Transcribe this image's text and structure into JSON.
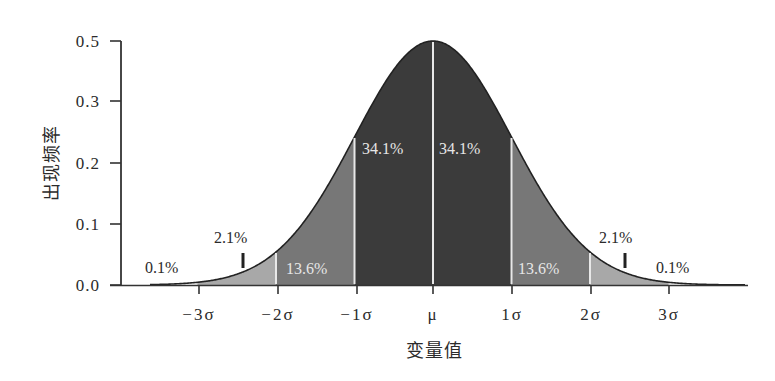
{
  "chart_data": {
    "type": "area",
    "title": "",
    "xlabel": "变量值",
    "ylabel": "出现频率",
    "x_ticks": [
      "-3σ",
      "-2σ",
      "-1σ",
      "μ",
      "1σ",
      "2σ",
      "3σ"
    ],
    "y_ticks": [
      "0.0",
      "0.1",
      "0.2",
      "0.3",
      "0.5"
    ],
    "ylim": [
      0,
      0.5
    ],
    "xlim": [
      -4,
      4
    ],
    "grid": false,
    "legend": null,
    "curve": "normal distribution (bell curve), mean μ, std σ",
    "regions": [
      {
        "range": [
          "-∞",
          "-3σ"
        ],
        "percent": "0.1%",
        "value": 0.1,
        "shade": "#ffffff"
      },
      {
        "range": [
          "-3σ",
          "-2σ"
        ],
        "percent": "2.1%",
        "value": 2.1,
        "shade": "#a9a9a9"
      },
      {
        "range": [
          "-2σ",
          "-1σ"
        ],
        "percent": "13.6%",
        "value": 13.6,
        "shade": "#7a7a7a"
      },
      {
        "range": [
          "-1σ",
          "μ"
        ],
        "percent": "34.1%",
        "value": 34.1,
        "shade": "#3d3d3d"
      },
      {
        "range": [
          "μ",
          "1σ"
        ],
        "percent": "34.1%",
        "value": 34.1,
        "shade": "#3d3d3d"
      },
      {
        "range": [
          "1σ",
          "2σ"
        ],
        "percent": "13.6%",
        "value": 13.6,
        "shade": "#7a7a7a"
      },
      {
        "range": [
          "2σ",
          "3σ"
        ],
        "percent": "2.1%",
        "value": 2.1,
        "shade": "#a9a9a9"
      },
      {
        "range": [
          "3σ",
          "+∞"
        ],
        "percent": "0.1%",
        "value": 0.1,
        "shade": "#ffffff"
      }
    ],
    "annotations": [
      "0.1%",
      "2.1%",
      "13.6%",
      "34.1%",
      "34.1%",
      "13.6%",
      "2.1%",
      "0.1%"
    ]
  },
  "axis": {
    "y_title": "出现频率",
    "x_title": "变量值",
    "y_ticks": [
      {
        "label": "0.5",
        "y": 41
      },
      {
        "label": "0.3",
        "y": 101
      },
      {
        "label": "0.2",
        "y": 163
      },
      {
        "label": "0.1",
        "y": 224
      },
      {
        "label": "0.0",
        "y": 285
      }
    ],
    "x_ticks": [
      {
        "label": "−3σ",
        "x": 199
      },
      {
        "label": "−2σ",
        "x": 278
      },
      {
        "label": "−1σ",
        "x": 357
      },
      {
        "label": "μ",
        "x": 433
      },
      {
        "label": "1σ",
        "x": 512
      },
      {
        "label": "2σ",
        "x": 591
      },
      {
        "label": "3σ",
        "x": 669
      }
    ]
  },
  "labels": {
    "left_tail": "0.1%",
    "left_2sd": "2.1%",
    "left_1sd": "13.6%",
    "left_center": "34.1%",
    "right_center": "34.1%",
    "right_1sd": "13.6%",
    "right_2sd": "2.1%",
    "right_tail": "0.1%"
  },
  "colors": {
    "center": "#3b3b3b",
    "one_to_two": "#777777",
    "two_to_three": "#a8a8a8",
    "divider": "#e8e8e8",
    "curve": "#222222",
    "axis": "#333333"
  }
}
